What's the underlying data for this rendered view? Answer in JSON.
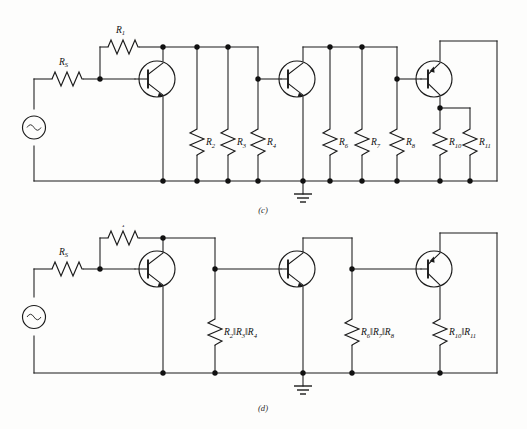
{
  "figure": {
    "background_color": "#fdfdfc",
    "line_color": "#1a1a1a"
  },
  "panels": [
    {
      "id": "panel-c",
      "caption": "(c)",
      "description": "Full three-stage amplifier with individual bias resistors",
      "source": {
        "name": "ac-source",
        "symbol": "~"
      },
      "series_resistors": [
        {
          "name": "Rs",
          "base": "R",
          "sub": "S",
          "label": "R",
          "subscript": "S"
        },
        {
          "name": "R1",
          "base": "R",
          "sub": "1",
          "label": "R",
          "subscript": "1"
        }
      ],
      "shunt_resistors": [
        {
          "name": "R2",
          "label": "R",
          "subscript": "2"
        },
        {
          "name": "R3",
          "label": "R",
          "subscript": "3"
        },
        {
          "name": "R4",
          "label": "R",
          "subscript": "4"
        },
        {
          "name": "R6",
          "label": "R",
          "subscript": "6"
        },
        {
          "name": "R7",
          "label": "R",
          "subscript": "7"
        },
        {
          "name": "R8",
          "label": "R",
          "subscript": "8"
        },
        {
          "name": "R10",
          "label": "R",
          "subscript": "10"
        },
        {
          "name": "R11",
          "label": "R",
          "subscript": "11"
        }
      ],
      "transistors": [
        {
          "name": "Q1",
          "type": "npn"
        },
        {
          "name": "Q2",
          "type": "npn"
        },
        {
          "name": "Q3",
          "type": "pnp"
        }
      ],
      "ground": {
        "name": "ground-symbol",
        "bars": 3
      }
    },
    {
      "id": "panel-d",
      "caption": "(d)",
      "description": "Simplified amplifier with parallel resistor combinations",
      "source": {
        "name": "ac-source",
        "symbol": "~"
      },
      "series_resistors": [
        {
          "name": "Rs",
          "base": "R",
          "sub": "S",
          "label": "R",
          "subscript": "S"
        },
        {
          "name": "R1",
          "base": "R",
          "sub": "1",
          "label": "R",
          "subscript": "1"
        }
      ],
      "shunt_resistors": [
        {
          "name": "R2-R3-R4-parallel",
          "terms": [
            {
              "label": "R",
              "subscript": "2"
            },
            {
              "label": "R",
              "subscript": "3"
            },
            {
              "label": "R",
              "subscript": "4"
            }
          ],
          "operator": "‖"
        },
        {
          "name": "R6-R7-R8-parallel",
          "terms": [
            {
              "label": "R",
              "subscript": "6"
            },
            {
              "label": "R",
              "subscript": "7"
            },
            {
              "label": "R",
              "subscript": "8"
            }
          ],
          "operator": "‖"
        },
        {
          "name": "R10-R11-parallel",
          "terms": [
            {
              "label": "R",
              "subscript": "10"
            },
            {
              "label": "R",
              "subscript": "11"
            }
          ],
          "operator": "‖"
        }
      ],
      "transistors": [
        {
          "name": "Q1",
          "type": "npn"
        },
        {
          "name": "Q2",
          "type": "npn"
        },
        {
          "name": "Q3",
          "type": "pnp"
        }
      ],
      "ground": {
        "name": "ground-symbol",
        "bars": 3
      }
    }
  ]
}
